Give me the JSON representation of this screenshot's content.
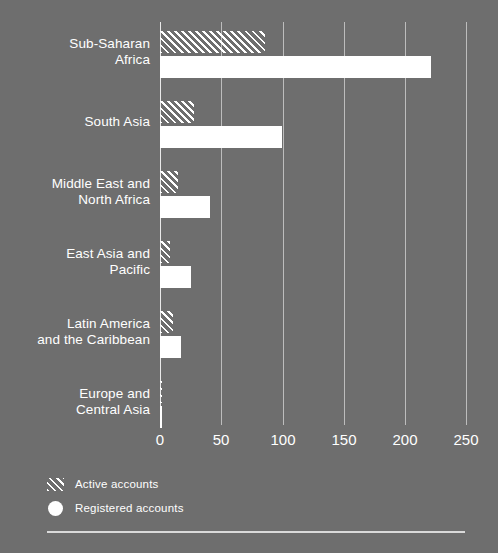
{
  "chart_data": {
    "type": "bar",
    "orientation": "horizontal",
    "title": "",
    "xlabel": "",
    "ylabel": "",
    "xlim": [
      0,
      250
    ],
    "xticks": [
      0,
      50,
      100,
      150,
      200,
      250
    ],
    "xtick_labels": [
      "0",
      "50",
      "100",
      "150",
      "200",
      "250"
    ],
    "grid": true,
    "legend_position": "bottom-left",
    "categories": [
      "Sub-Saharan\nAfrica",
      "South Asia",
      "Middle East and\nNorth Africa",
      "East Asia and\nPacific",
      "Latin America\nand the Caribbean",
      "Europe and\nCentral Asia"
    ],
    "series": [
      {
        "name": "Active accounts",
        "style": "hatched",
        "values": [
          86,
          28,
          15,
          8,
          11,
          2
        ]
      },
      {
        "name": "Registered accounts",
        "style": "solid",
        "values": [
          221,
          100,
          41,
          25,
          17,
          2
        ]
      }
    ],
    "colors": {
      "background": "#6e6e6e",
      "foreground": "#ffffff",
      "gridline": "rgba(255,255,255,0.55)"
    }
  },
  "legend": {
    "items": [
      {
        "label": "Active accounts",
        "swatch": "hatch-swatch-icon"
      },
      {
        "label": "Registered accounts",
        "swatch": "circle-swatch-icon"
      }
    ]
  }
}
